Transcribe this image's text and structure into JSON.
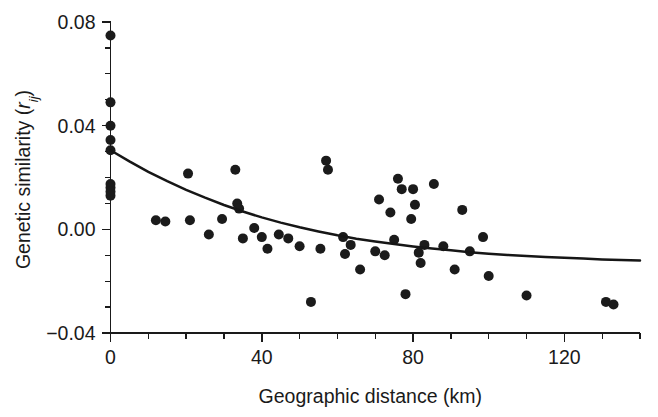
{
  "chart_data": {
    "type": "scatter",
    "title": "",
    "subtitle": "",
    "xlabel": "Geographic distance (km)",
    "ylabel_prefix": "Genetic similarity (",
    "ylabel_symbol": "r",
    "ylabel_subscript": "ij",
    "ylabel_suffix": ")",
    "ylabel_full": "Genetic similarity (rij)",
    "xlim": [
      0,
      140
    ],
    "ylim": [
      -0.04,
      0.08
    ],
    "x_ticks": [
      0,
      40,
      80,
      120
    ],
    "x_tick_labels": [
      "0",
      "40",
      "80",
      "120"
    ],
    "x_minor_step": 10,
    "y_ticks": [
      -0.04,
      0.0,
      0.04,
      0.08
    ],
    "y_tick_labels": [
      "−0.04",
      "0.00",
      "0.04",
      "0.08"
    ],
    "y_minor_step": 0.01,
    "grid": false,
    "legend": "none",
    "marker": "filled-circle",
    "marker_color": "#1b1b1b",
    "marker_radius_px": 5.0,
    "curve_color": "#161616",
    "curve_label": "fitted decay curve",
    "axis_color": "#1a1a1a",
    "series": [
      {
        "name": "pairwise genetic similarity",
        "points": [
          [
            0.0,
            0.0748
          ],
          [
            0.0,
            0.049
          ],
          [
            0.0,
            0.04
          ],
          [
            0.0,
            0.0345
          ],
          [
            0.0,
            0.0305
          ],
          [
            0.0,
            0.0175
          ],
          [
            0.0,
            0.016
          ],
          [
            0.0,
            0.0145
          ],
          [
            0.0,
            0.013
          ],
          [
            12.0,
            0.0035
          ],
          [
            14.5,
            0.003
          ],
          [
            20.5,
            0.0215
          ],
          [
            21.0,
            0.0035
          ],
          [
            26.0,
            -0.002
          ],
          [
            29.5,
            0.004
          ],
          [
            33.0,
            0.023
          ],
          [
            33.5,
            0.01
          ],
          [
            34.0,
            0.008
          ],
          [
            35.0,
            -0.0035
          ],
          [
            38.0,
            0.0005
          ],
          [
            40.0,
            -0.003
          ],
          [
            41.5,
            -0.0075
          ],
          [
            44.5,
            -0.002
          ],
          [
            47.0,
            -0.0035
          ],
          [
            50.0,
            -0.0065
          ],
          [
            53.0,
            -0.028
          ],
          [
            55.5,
            -0.0075
          ],
          [
            57.0,
            0.0265
          ],
          [
            57.5,
            0.023
          ],
          [
            61.5,
            -0.003
          ],
          [
            62.0,
            -0.0095
          ],
          [
            63.5,
            -0.006
          ],
          [
            66.0,
            -0.0155
          ],
          [
            70.0,
            -0.0085
          ],
          [
            71.0,
            0.0115
          ],
          [
            72.5,
            -0.01
          ],
          [
            74.0,
            0.0065
          ],
          [
            75.0,
            -0.004
          ],
          [
            76.0,
            0.0195
          ],
          [
            77.0,
            0.0155
          ],
          [
            78.0,
            -0.025
          ],
          [
            79.5,
            0.004
          ],
          [
            80.0,
            0.0155
          ],
          [
            80.5,
            0.0095
          ],
          [
            81.5,
            -0.009
          ],
          [
            82.0,
            -0.013
          ],
          [
            83.0,
            -0.006
          ],
          [
            85.5,
            0.0175
          ],
          [
            88.0,
            -0.0065
          ],
          [
            91.0,
            -0.0155
          ],
          [
            93.0,
            0.0075
          ],
          [
            95.0,
            -0.0085
          ],
          [
            98.5,
            -0.003
          ],
          [
            100.0,
            -0.018
          ],
          [
            110.0,
            -0.0255
          ],
          [
            131.0,
            -0.028
          ],
          [
            133.0,
            -0.029
          ]
        ]
      }
    ],
    "curve": {
      "name": "exponential decay fit",
      "points": [
        [
          0.0,
          0.0305
        ],
        [
          5.0,
          0.0262
        ],
        [
          10.0,
          0.0222
        ],
        [
          15.0,
          0.0186
        ],
        [
          20.0,
          0.0152
        ],
        [
          25.0,
          0.0122
        ],
        [
          30.0,
          0.0094
        ],
        [
          35.0,
          0.0069
        ],
        [
          40.0,
          0.0046
        ],
        [
          45.0,
          0.0026
        ],
        [
          50.0,
          0.0008
        ],
        [
          55.0,
          -0.0008
        ],
        [
          60.0,
          -0.0023
        ],
        [
          65.0,
          -0.0036
        ],
        [
          70.0,
          -0.0047
        ],
        [
          75.0,
          -0.0057
        ],
        [
          80.0,
          -0.0066
        ],
        [
          85.0,
          -0.0074
        ],
        [
          90.0,
          -0.0081
        ],
        [
          95.0,
          -0.0088
        ],
        [
          100.0,
          -0.0094
        ],
        [
          105.0,
          -0.0099
        ],
        [
          110.0,
          -0.0103
        ],
        [
          115.0,
          -0.0107
        ],
        [
          120.0,
          -0.011
        ],
        [
          125.0,
          -0.0113
        ],
        [
          130.0,
          -0.0116
        ],
        [
          135.0,
          -0.0118
        ],
        [
          140.0,
          -0.012
        ]
      ]
    }
  }
}
